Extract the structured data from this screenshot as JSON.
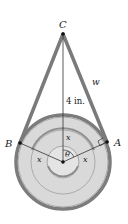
{
  "diagram": {
    "type": "belt-pulley-geometry",
    "labels": {
      "top_point": "C",
      "left_point": "B",
      "right_point": "A",
      "belt_side": "w",
      "height": "4 in.",
      "radius_top": "x",
      "radius_left": "x",
      "radius_right": "x",
      "angle": "θ"
    },
    "colors": {
      "belt": "#8a8a8a",
      "belt_edge": "#5e5e5e",
      "pulley_fill": "#d9d9d9",
      "groove": "#a8a8a8",
      "hub_fill": "#e6e6e6",
      "lines": "#333333",
      "background": "#ffffff"
    }
  }
}
